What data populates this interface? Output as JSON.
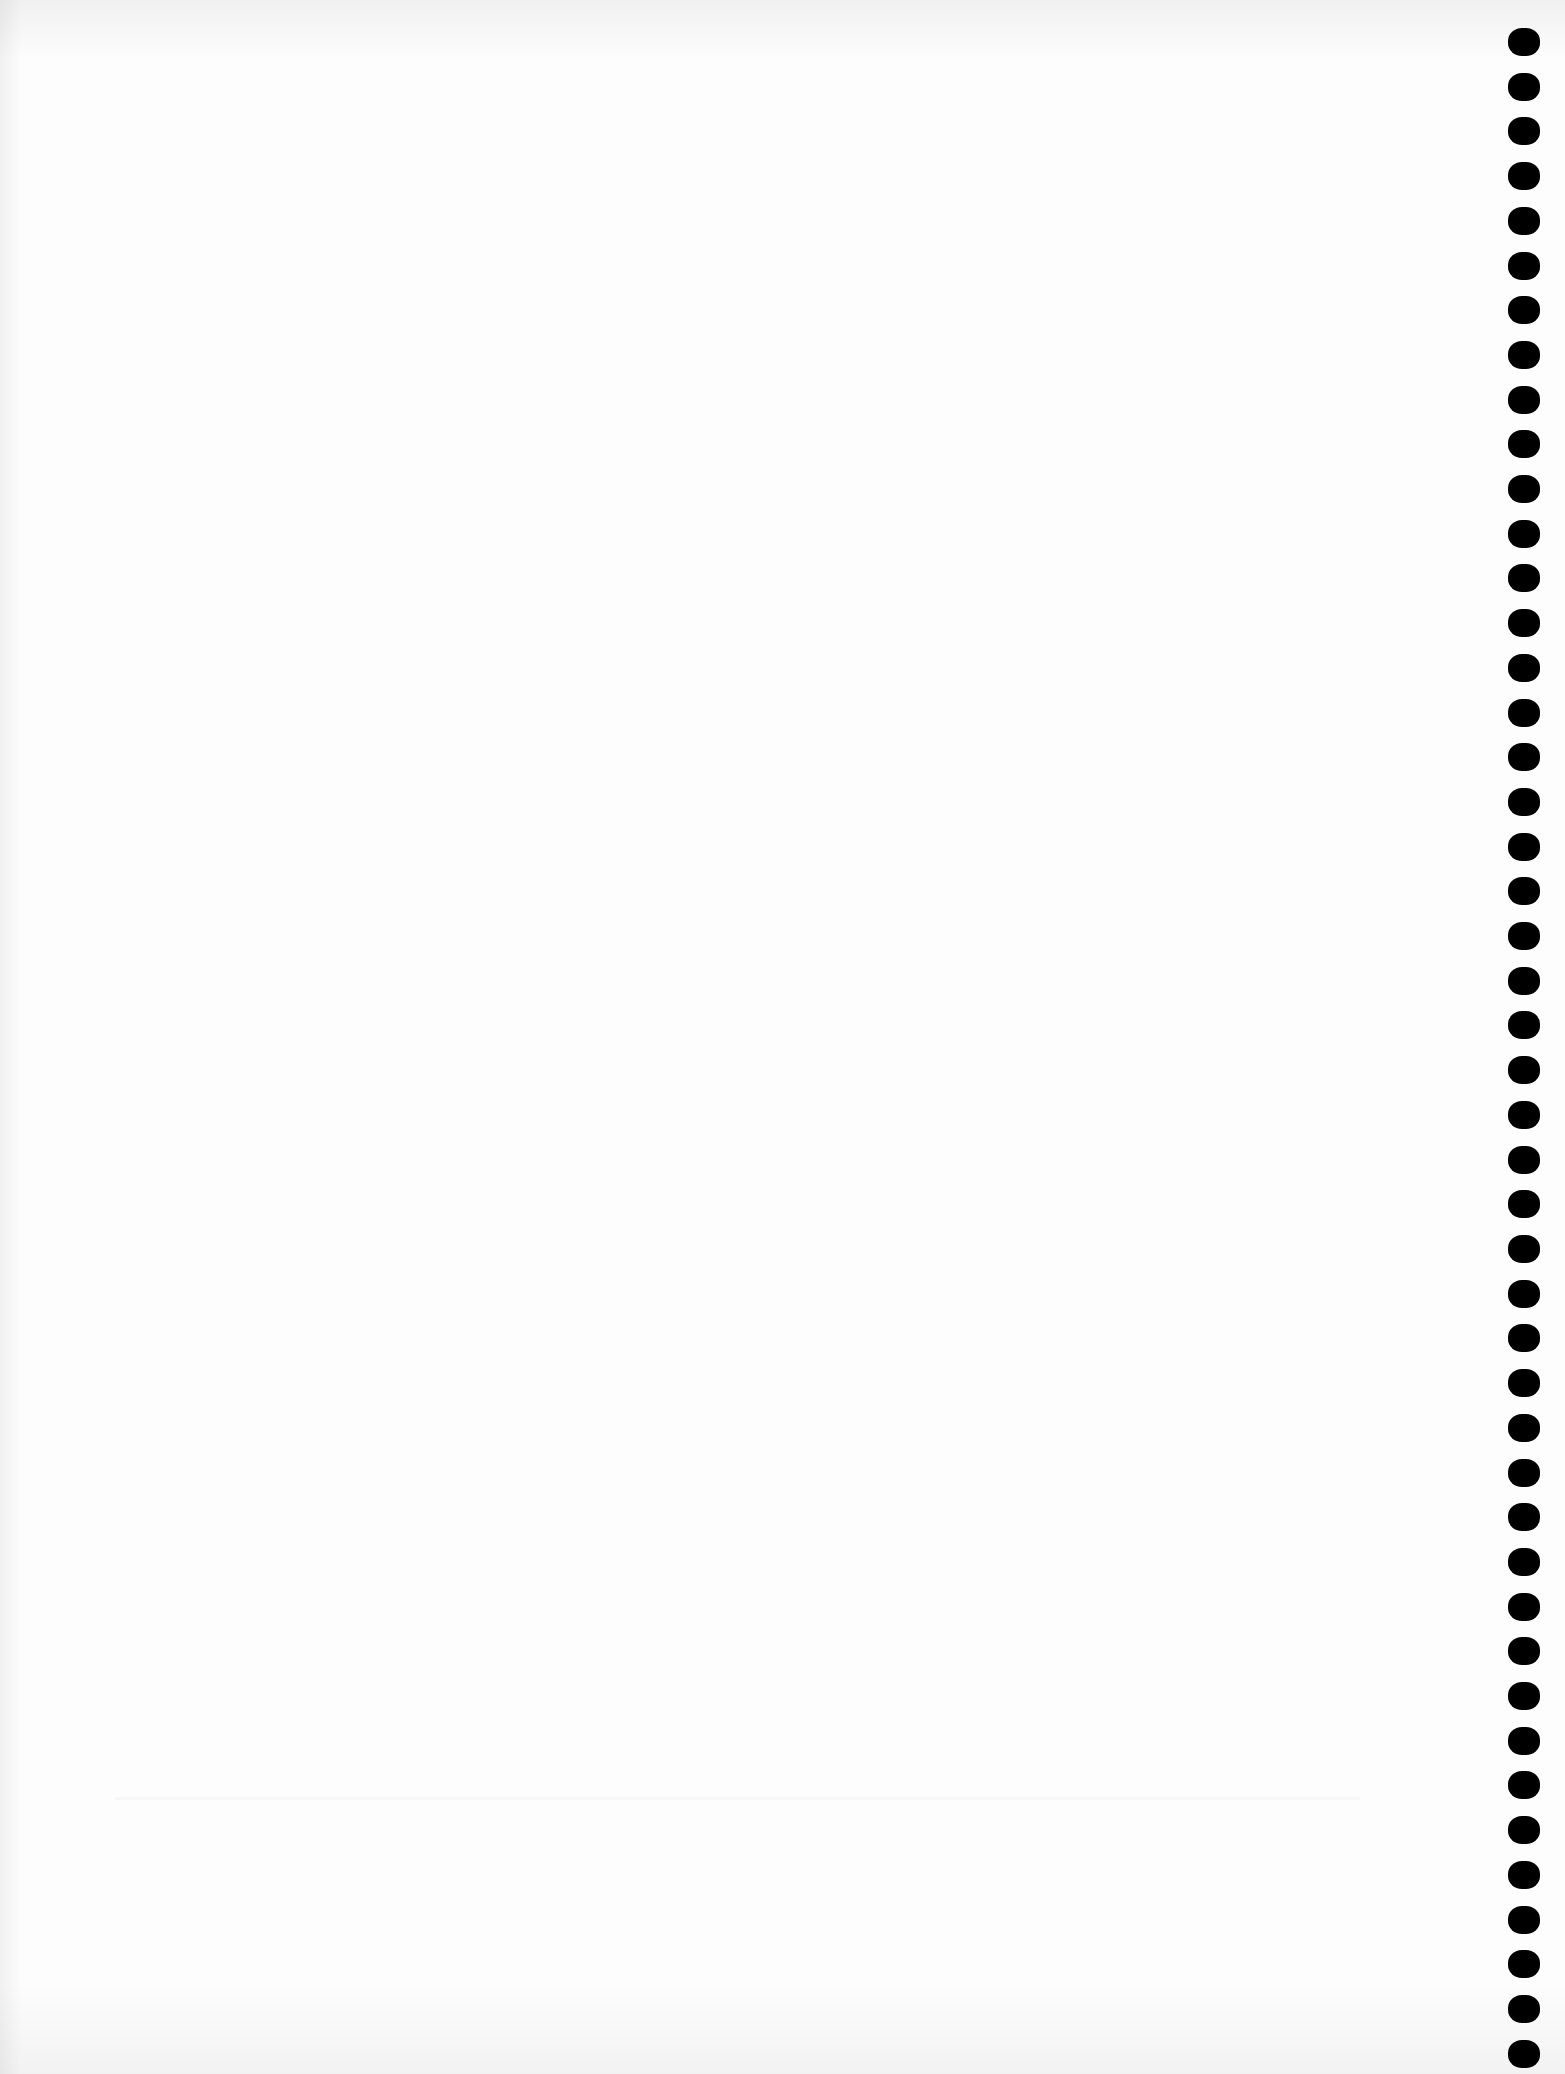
{
  "page": {
    "type": "blank scanned page",
    "background_color": "#fdfdfd",
    "text_content": ""
  },
  "binding": {
    "side": "right",
    "hole_count": 46,
    "hole_shape": "rounded-rectangle",
    "hole_color": "#000000"
  }
}
